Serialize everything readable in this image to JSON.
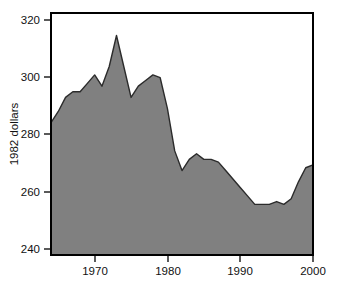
{
  "chart_data": {
    "type": "area",
    "title": "",
    "subtitle": "",
    "xlabel": "",
    "ylabel": "1982 dollars",
    "xlim": [
      1964,
      2000
    ],
    "ylim": [
      236,
      322
    ],
    "grid": false,
    "legend": null,
    "annotations": [],
    "series_fill_color": "#808080",
    "line_color": "#2b2b2b",
    "frame_color": "#000000",
    "x_tick_labels": [
      "1970",
      "1980",
      "1990",
      "2000"
    ],
    "x_ticks": [
      1970,
      1980,
      1990,
      2000
    ],
    "y_tick_labels": [
      "240",
      "260",
      "280",
      "300",
      "320"
    ],
    "y_ticks": [
      240,
      260,
      280,
      300,
      320
    ],
    "x": [
      1964,
      1965,
      1966,
      1967,
      1968,
      1969,
      1970,
      1971,
      1972,
      1973,
      1974,
      1975,
      1976,
      1977,
      1978,
      1979,
      1980,
      1981,
      1982,
      1983,
      1984,
      1985,
      1986,
      1987,
      1988,
      1989,
      1990,
      1991,
      1992,
      1993,
      1994,
      1995,
      1996,
      1997,
      1998,
      1999,
      2000
    ],
    "values": [
      283,
      287,
      292,
      294,
      294,
      297,
      300,
      296,
      303,
      314,
      303,
      292,
      296,
      298,
      300,
      299,
      288,
      273,
      266,
      270,
      272,
      270,
      270,
      269,
      266,
      263,
      260,
      257,
      254,
      254,
      254,
      255,
      254,
      256,
      262,
      267,
      268
    ],
    "series": [
      {
        "name": "1982 dollars",
        "values": [
          283,
          287,
          292,
          294,
          294,
          297,
          300,
          296,
          303,
          314,
          303,
          292,
          296,
          298,
          300,
          299,
          288,
          273,
          266,
          270,
          272,
          270,
          270,
          269,
          266,
          263,
          260,
          257,
          254,
          254,
          254,
          255,
          254,
          256,
          262,
          267,
          268
        ]
      }
    ]
  },
  "axes": {
    "y_axis_title": "1982 dollars",
    "y_tick_240": "240",
    "y_tick_260": "260",
    "y_tick_280": "280",
    "y_tick_300": "300",
    "y_tick_320": "320",
    "x_tick_1970": "1970",
    "x_tick_1980": "1980",
    "x_tick_1990": "1990",
    "x_tick_2000": "2000"
  }
}
